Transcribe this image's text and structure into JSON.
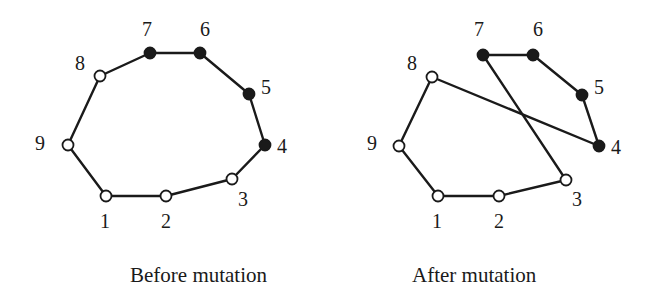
{
  "diagrams": [
    {
      "caption": "Before mutation",
      "nodes": [
        {
          "id": "1",
          "label": "1",
          "x": 106,
          "y": 196,
          "filled": false,
          "lx": 100,
          "ly": 228
        },
        {
          "id": "2",
          "label": "2",
          "x": 166,
          "y": 196,
          "filled": false,
          "lx": 161,
          "ly": 228
        },
        {
          "id": "3",
          "label": "3",
          "x": 232,
          "y": 179,
          "filled": false,
          "lx": 238,
          "ly": 206
        },
        {
          "id": "4",
          "label": "4",
          "x": 265,
          "y": 145,
          "filled": true,
          "lx": 277,
          "ly": 153
        },
        {
          "id": "5",
          "label": "5",
          "x": 249,
          "y": 94,
          "filled": true,
          "lx": 261,
          "ly": 94
        },
        {
          "id": "6",
          "label": "6",
          "x": 200,
          "y": 53,
          "filled": true,
          "lx": 200,
          "ly": 36
        },
        {
          "id": "7",
          "label": "7",
          "x": 150,
          "y": 53,
          "filled": true,
          "lx": 142,
          "ly": 36
        },
        {
          "id": "8",
          "label": "8",
          "x": 100,
          "y": 76,
          "filled": false,
          "lx": 75,
          "ly": 70
        },
        {
          "id": "9",
          "label": "9",
          "x": 68,
          "y": 145,
          "filled": false,
          "lx": 35,
          "ly": 150
        }
      ],
      "edges": [
        [
          "1",
          "2"
        ],
        [
          "2",
          "3"
        ],
        [
          "3",
          "4"
        ],
        [
          "4",
          "5"
        ],
        [
          "5",
          "6"
        ],
        [
          "6",
          "7"
        ],
        [
          "7",
          "8"
        ],
        [
          "8",
          "9"
        ],
        [
          "9",
          "1"
        ]
      ],
      "caption_x": 130,
      "caption_y": 282
    },
    {
      "caption": "After mutation",
      "nodes": [
        {
          "id": "1",
          "label": "1",
          "x": 438,
          "y": 196,
          "filled": false,
          "lx": 432,
          "ly": 228
        },
        {
          "id": "2",
          "label": "2",
          "x": 499,
          "y": 196,
          "filled": false,
          "lx": 494,
          "ly": 228
        },
        {
          "id": "3",
          "label": "3",
          "x": 566,
          "y": 180,
          "filled": false,
          "lx": 572,
          "ly": 206
        },
        {
          "id": "4",
          "label": "4",
          "x": 599,
          "y": 146,
          "filled": true,
          "lx": 611,
          "ly": 154
        },
        {
          "id": "5",
          "label": "5",
          "x": 582,
          "y": 95,
          "filled": true,
          "lx": 594,
          "ly": 94
        },
        {
          "id": "6",
          "label": "6",
          "x": 533,
          "y": 55,
          "filled": true,
          "lx": 533,
          "ly": 36
        },
        {
          "id": "7",
          "label": "7",
          "x": 483,
          "y": 55,
          "filled": true,
          "lx": 474,
          "ly": 36
        },
        {
          "id": "8",
          "label": "8",
          "x": 432,
          "y": 77,
          "filled": false,
          "lx": 407,
          "ly": 70
        },
        {
          "id": "9",
          "label": "9",
          "x": 399,
          "y": 146,
          "filled": false,
          "lx": 367,
          "ly": 150
        }
      ],
      "edges": [
        [
          "1",
          "2"
        ],
        [
          "2",
          "3"
        ],
        [
          "3",
          "7"
        ],
        [
          "7",
          "6"
        ],
        [
          "6",
          "5"
        ],
        [
          "5",
          "4"
        ],
        [
          "4",
          "8"
        ],
        [
          "8",
          "9"
        ],
        [
          "9",
          "1"
        ]
      ],
      "caption_x": 412,
      "caption_y": 282
    }
  ],
  "colors": {
    "stroke": "#1a1a1a",
    "filled_node": "#1a1a1a",
    "open_node": "#ffffff"
  }
}
